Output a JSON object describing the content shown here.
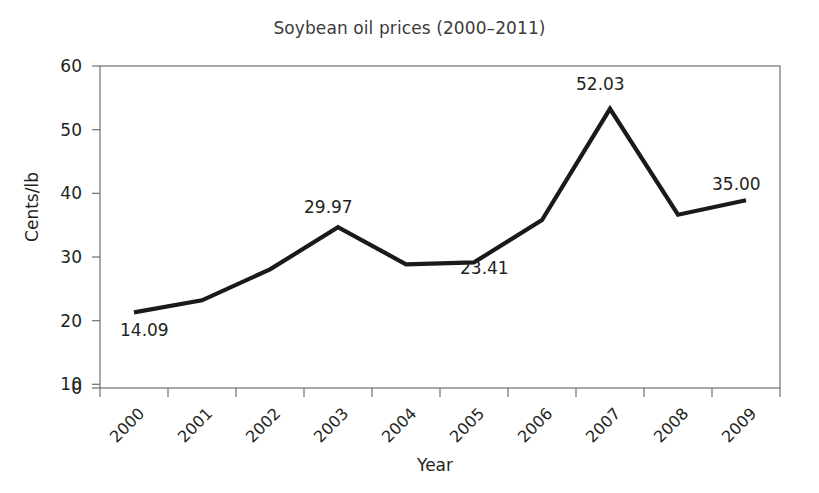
{
  "chart_data": {
    "type": "line",
    "title": "Soybean oil prices (2000–2011)",
    "xlabel": "Year",
    "ylabel": "Cents/lb",
    "categories": [
      "2000",
      "2001",
      "2002",
      "2003",
      "2004",
      "2005",
      "2006",
      "2007",
      "2008",
      "2009"
    ],
    "values": [
      14.09,
      16.35,
      22.1,
      29.97,
      23.05,
      23.41,
      31.3,
      52.03,
      32.3,
      35.0
    ],
    "ylim": [
      0,
      60
    ],
    "yticks": [
      0,
      10,
      20,
      30,
      40,
      50,
      60
    ],
    "ytick_labels": [
      "0",
      "10",
      "20",
      "30",
      "40",
      "50",
      "60"
    ],
    "grid": false,
    "legend": false,
    "line_color": "#1a1a1a",
    "point_labels": [
      {
        "category": "2000",
        "value": 14.09,
        "text": "14.09",
        "position": "below-right"
      },
      {
        "category": "2003",
        "value": 29.97,
        "text": "29.97",
        "position": "above"
      },
      {
        "category": "2005",
        "value": 23.41,
        "text": "23.41",
        "position": "below"
      },
      {
        "category": "2007",
        "value": 52.03,
        "text": "52.03",
        "position": "above"
      },
      {
        "category": "2009",
        "value": 35.0,
        "text": "35.00",
        "position": "above-left"
      }
    ]
  }
}
